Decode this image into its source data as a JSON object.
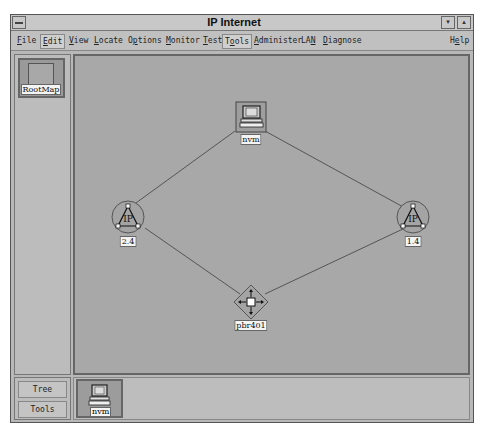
{
  "window": {
    "title": "IP Internet",
    "buttons": {
      "minimize": "▾",
      "maximize": "▴"
    }
  },
  "menubar": {
    "items": [
      {
        "label": "File",
        "mnemonic": "F"
      },
      {
        "label": "Edit",
        "mnemonic": "E",
        "active": true
      },
      {
        "label": "View",
        "mnemonic": "V"
      },
      {
        "label": "Locate",
        "mnemonic": "L"
      },
      {
        "label": "Options",
        "mnemonic": "p"
      },
      {
        "label": "Monitor",
        "mnemonic": "M"
      },
      {
        "label": "Test",
        "mnemonic": "T"
      },
      {
        "label": "Tools",
        "mnemonic": "o",
        "active": true
      },
      {
        "label": "Administer",
        "mnemonic": "A"
      },
      {
        "label": "LAN",
        "mnemonic": "N"
      },
      {
        "label": "Diagnose",
        "mnemonic": "D"
      },
      {
        "label": "Help",
        "mnemonic": "e"
      }
    ]
  },
  "sidebar": {
    "rootmap_label": "RootMap",
    "buttons": {
      "tree": "Tree",
      "tools": "Tools"
    }
  },
  "map": {
    "nodes": [
      {
        "id": "nvm-top",
        "type": "workstation",
        "label": "nvm"
      },
      {
        "id": "ip-left",
        "type": "ip-network",
        "label": "2.4"
      },
      {
        "id": "ip-right",
        "type": "ip-network",
        "label": "1.4"
      },
      {
        "id": "router",
        "type": "router",
        "label": "pbr401"
      }
    ],
    "links": [
      [
        "nvm-top",
        "ip-left"
      ],
      [
        "nvm-top",
        "ip-right"
      ],
      [
        "ip-left",
        "router"
      ],
      [
        "ip-right",
        "router"
      ]
    ]
  },
  "tray": {
    "items": [
      {
        "label": "nvm",
        "icon": "workstation-icon"
      }
    ]
  }
}
